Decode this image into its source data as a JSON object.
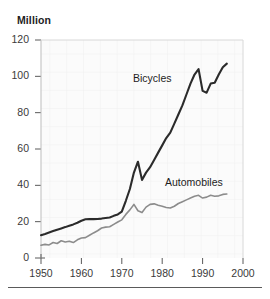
{
  "chart_data": {
    "type": "line",
    "title": "",
    "subtitle": "",
    "unit_label": "Million",
    "xlabel": "",
    "ylabel": "Million",
    "xlim": [
      1950,
      2000
    ],
    "ylim": [
      0,
      120
    ],
    "xticks": [
      1950,
      1960,
      1970,
      1980,
      1990,
      2000
    ],
    "yticks": [
      0,
      20,
      40,
      60,
      80,
      100,
      120
    ],
    "xtick_labels": [
      "1950",
      "1960",
      "1970",
      "1980",
      "1990",
      "2000"
    ],
    "ytick_labels": [
      "0",
      "20",
      "40",
      "60",
      "80",
      "100",
      "120"
    ],
    "grid": true,
    "legend": "inline-labels",
    "annotations": [
      {
        "name": "Bicycles",
        "x": 1982,
        "y": 96
      },
      {
        "name": "Automobiles",
        "x": 1987,
        "y": 42
      }
    ],
    "series": [
      {
        "name": "Bicycles",
        "color": "#2b2b2b",
        "x": [
          1950,
          1951,
          1952,
          1953,
          1954,
          1955,
          1956,
          1957,
          1958,
          1959,
          1960,
          1961,
          1962,
          1963,
          1964,
          1965,
          1966,
          1967,
          1968,
          1969,
          1970,
          1971,
          1972,
          1973,
          1974,
          1975,
          1976,
          1977,
          1978,
          1979,
          1980,
          1981,
          1982,
          1983,
          1984,
          1985,
          1986,
          1987,
          1988,
          1989,
          1990,
          1991,
          1992,
          1993,
          1994,
          1995,
          1996
        ],
        "values": [
          12.5,
          13.2,
          14.0,
          14.8,
          15.6,
          16.3,
          17.0,
          17.8,
          18.5,
          19.4,
          20.5,
          21.3,
          21.4,
          21.4,
          21.5,
          21.7,
          22.0,
          22.3,
          23.2,
          24.0,
          25.5,
          31.5,
          38.0,
          47.0,
          53.0,
          43.0,
          47.0,
          50.0,
          54.0,
          58.0,
          62.0,
          66.0,
          69.0,
          74.0,
          79.0,
          84.0,
          90.0,
          96.0,
          101.0,
          104.0,
          92.0,
          91.0,
          96.0,
          96.5,
          101.0,
          105.0,
          107.0
        ]
      },
      {
        "name": "Automobiles",
        "color": "#8c8c8c",
        "x": [
          1950,
          1951,
          1952,
          1953,
          1954,
          1955,
          1956,
          1957,
          1958,
          1959,
          1960,
          1961,
          1962,
          1963,
          1964,
          1965,
          1966,
          1967,
          1968,
          1969,
          1970,
          1971,
          1972,
          1973,
          1974,
          1975,
          1976,
          1977,
          1978,
          1979,
          1980,
          1981,
          1982,
          1983,
          1984,
          1985,
          1986,
          1987,
          1988,
          1989,
          1990,
          1991,
          1992,
          1993,
          1994,
          1995,
          1996
        ],
        "values": [
          7.0,
          7.5,
          7.2,
          8.5,
          8.0,
          9.5,
          8.8,
          9.2,
          8.5,
          10.0,
          11.0,
          11.2,
          12.5,
          13.8,
          15.0,
          16.5,
          17.0,
          17.2,
          18.5,
          19.8,
          21.0,
          24.0,
          26.5,
          29.5,
          26.0,
          25.0,
          28.0,
          29.5,
          29.8,
          29.0,
          28.5,
          27.8,
          27.5,
          28.5,
          30.0,
          31.0,
          32.0,
          33.0,
          34.0,
          34.5,
          33.0,
          33.5,
          34.5,
          34.0,
          34.2,
          35.0,
          35.2
        ]
      }
    ]
  }
}
